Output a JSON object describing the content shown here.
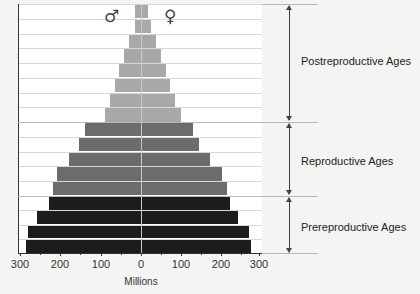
{
  "chart_data": {
    "type": "bar",
    "subtype": "population-pyramid",
    "title": "",
    "xlabel": "Millions",
    "ylabel": "",
    "xlim": [
      -300,
      300
    ],
    "x_ticks": [
      "300",
      "200",
      "100",
      "0",
      "100",
      "200",
      "300"
    ],
    "grid": true,
    "legend": {
      "male_symbol": "♂",
      "female_symbol": "♀",
      "position": "top"
    },
    "categories_top_to_bottom": [
      "row-1",
      "row-2",
      "row-3",
      "row-4",
      "row-5",
      "row-6",
      "row-7",
      "row-8",
      "row-9",
      "row-10",
      "row-11",
      "row-12",
      "row-13",
      "row-14",
      "row-15",
      "row-16",
      "row-17"
    ],
    "series": [
      {
        "name": "Male",
        "side": "left",
        "values": [
          15,
          15,
          30,
          42,
          55,
          65,
          78,
          90,
          140,
          155,
          178,
          208,
          220,
          230,
          258,
          280,
          285
        ]
      },
      {
        "name": "Female",
        "side": "right",
        "values": [
          15,
          22,
          35,
          48,
          60,
          70,
          82,
          97,
          128,
          143,
          168,
          200,
          212,
          218,
          238,
          265,
          270
        ]
      }
    ],
    "groups": [
      {
        "label": "Postreproductive Ages",
        "rows": [
          0,
          8
        ],
        "color": "#a8a8a8"
      },
      {
        "label": "Reproductive Ages",
        "rows": [
          8,
          13
        ],
        "color": "#6c6c6c"
      },
      {
        "label": "Prereproductive Ages",
        "rows": [
          13,
          17
        ],
        "color": "#1c1c1c"
      }
    ]
  },
  "labels": {
    "xlabel": "Millions",
    "male": "♂",
    "female": "♀",
    "postreproductive": "Postreproductive Ages",
    "reproductive": "Reproductive Ages",
    "prereproductive": "Prereproductive Ages",
    "ticks": [
      "300",
      "200",
      "100",
      "0",
      "100",
      "200",
      "300"
    ]
  }
}
